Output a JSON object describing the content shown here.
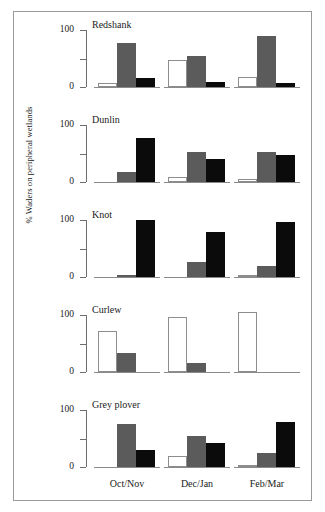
{
  "figure": {
    "ylabel": "% Waders on peripheral wetlands",
    "y_ticks": [
      "100",
      "0"
    ],
    "x_categories": [
      "Oct/Nov",
      "Dec/Jan",
      "Feb/Mar"
    ]
  },
  "chart_data": {
    "type": "bar",
    "title": "",
    "xlabel": "",
    "ylabel": "% Waders on peripheral wetlands",
    "ylim": [
      0,
      100
    ],
    "y_ticks": [
      0,
      50,
      100
    ],
    "y_tick_labels": [
      "0",
      "",
      "100"
    ],
    "grid": false,
    "legend_position": "none",
    "categories": [
      "Oct/Nov",
      "Dec/Jan",
      "Feb/Mar"
    ],
    "series": [
      {
        "name": "white",
        "color": "#ffffff"
      },
      {
        "name": "gray",
        "color": "#5b5b5b"
      },
      {
        "name": "black",
        "color": "#0b0b0b"
      }
    ],
    "panels": [
      {
        "name": "Redshank",
        "groups": [
          {
            "category": "Oct/Nov",
            "white": 7,
            "gray": 78,
            "black": 15
          },
          {
            "category": "Dec/Jan",
            "white": 48,
            "gray": 54,
            "black": 8
          },
          {
            "category": "Feb/Mar",
            "white": 18,
            "gray": 89,
            "black": 7
          }
        ]
      },
      {
        "name": "Dunlin",
        "groups": [
          {
            "category": "Oct/Nov",
            "white": 0,
            "gray": 18,
            "black": 78
          },
          {
            "category": "Dec/Jan",
            "white": 8,
            "gray": 53,
            "black": 40
          },
          {
            "category": "Feb/Mar",
            "white": 6,
            "gray": 52,
            "black": 47
          }
        ]
      },
      {
        "name": "Knot",
        "groups": [
          {
            "category": "Oct/Nov",
            "white": 0,
            "gray": 3,
            "black": 100
          },
          {
            "category": "Dec/Jan",
            "white": 0,
            "gray": 26,
            "black": 79
          },
          {
            "category": "Feb/Mar",
            "white": 3,
            "gray": 20,
            "black": 97
          }
        ]
      },
      {
        "name": "Curlew",
        "groups": [
          {
            "category": "Oct/Nov",
            "white": 72,
            "gray": 33,
            "black": 0
          },
          {
            "category": "Dec/Jan",
            "white": 97,
            "gray": 15,
            "black": 0
          },
          {
            "category": "Feb/Mar",
            "white": 105,
            "gray": 0,
            "black": 0
          }
        ]
      },
      {
        "name": "Grey plover",
        "groups": [
          {
            "category": "Oct/Nov",
            "white": 0,
            "gray": 76,
            "black": 30
          },
          {
            "category": "Dec/Jan",
            "white": 20,
            "gray": 54,
            "black": 42
          },
          {
            "category": "Feb/Mar",
            "white": 4,
            "gray": 25,
            "black": 79
          }
        ]
      }
    ]
  }
}
